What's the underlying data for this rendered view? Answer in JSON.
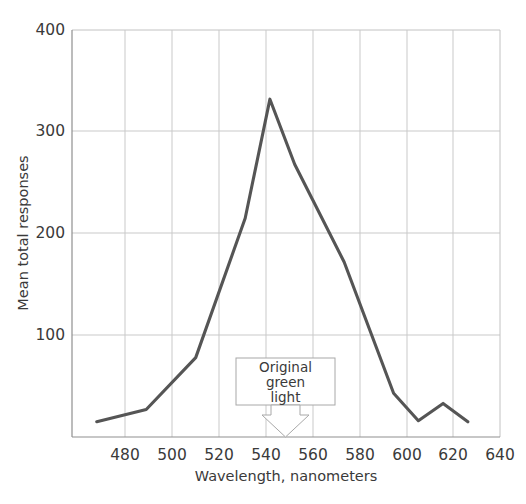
{
  "chart_data": {
    "type": "line",
    "title": "",
    "xlabel": "Wavelength, nanometers",
    "ylabel": "Mean total responses",
    "xlim": [
      470,
      643
    ],
    "ylim": [
      0,
      400
    ],
    "grid": true,
    "legend": "none",
    "x_ticks": [
      480,
      500,
      520,
      540,
      560,
      580,
      600,
      620,
      640
    ],
    "y_ticks": [
      100,
      200,
      300,
      400
    ],
    "x_tick_labels": [
      "480",
      "500",
      "520",
      "540",
      "560",
      "580",
      "600",
      "620",
      "640"
    ],
    "y_tick_labels": [
      "100",
      "200",
      "300",
      "400"
    ],
    "series": [
      {
        "name": "Mean total responses",
        "color": "#555555",
        "x": [
          480,
          500,
          520,
          540,
          550,
          560,
          580,
          600,
          610,
          620,
          630
        ],
        "values": [
          15,
          27,
          78,
          215,
          332,
          268,
          172,
          43,
          16,
          33,
          15
        ]
      }
    ],
    "annotations": [
      {
        "name": "original-green-light",
        "lines": [
          "Original",
          "green",
          "light"
        ],
        "text": "Original green light",
        "points_to_x": 550,
        "points_to_y": 0
      }
    ]
  },
  "axis": {
    "x_title": "Wavelength, nanometers",
    "y_title": "Mean total responses",
    "x_labels": [
      "480",
      "500",
      "520",
      "540",
      "560",
      "580",
      "600",
      "620",
      "640"
    ],
    "y_labels": [
      "100",
      "200",
      "300",
      "400"
    ]
  },
  "annotation": {
    "line1": "Original",
    "line2": "green",
    "line3": "light"
  },
  "colors": {
    "series": "#555555",
    "grid": "#c9c9c9",
    "axis": "#9a9a9a",
    "text": "#3a3a3a",
    "background": "#ffffff"
  }
}
